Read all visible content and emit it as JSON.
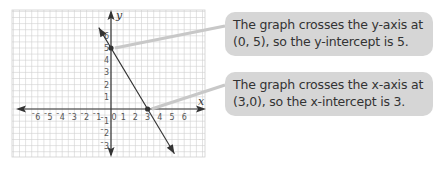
{
  "chart_data": {
    "type": "line",
    "title": "",
    "xlabel": "x",
    "ylabel": "y",
    "x_ticks": [
      -6,
      -5,
      -4,
      -3,
      -2,
      -1,
      0,
      1,
      2,
      3,
      4,
      5,
      6
    ],
    "y_ticks": [
      -3,
      -2,
      -1,
      1,
      2,
      3,
      4,
      5,
      6
    ],
    "xlim": [
      -7.5,
      7.5
    ],
    "ylim": [
      -4,
      8
    ],
    "grid": true,
    "series": [
      {
        "name": "line",
        "equation": "y = -5/3 x + 5",
        "x": [
          -1,
          0,
          3,
          5.2
        ],
        "y": [
          6.67,
          5,
          0,
          -3.67
        ]
      }
    ],
    "points": [
      {
        "label": "y-intercept",
        "x": 0,
        "y": 5
      },
      {
        "label": "x-intercept",
        "x": 3,
        "y": 0
      }
    ]
  },
  "callouts": [
    {
      "line1": "The graph crosses the y-axis at",
      "line2": "(0, 5), so the y-intercept is 5."
    },
    {
      "line1": "The graph crosses the x-axis at",
      "line2": "(3,0), so the x-intercept is 3."
    }
  ],
  "colors": {
    "callout_bg": "#d6d6d6",
    "leader": "#c8c8c8",
    "axis": "#333333",
    "grid": "#d0d0d0"
  }
}
